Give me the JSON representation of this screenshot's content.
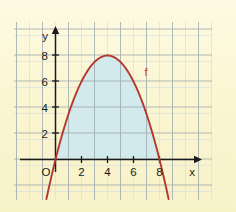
{
  "figure": {
    "background_color": "#fbf6d2",
    "grid_color": "#9aa8b0",
    "grid_minor_color": "#c9d2d4",
    "axis_color": "#1a1a1a",
    "curve_color": "#b43830",
    "fill_color": "#cfe8ef",
    "curve_label": "f",
    "origin_label": "O",
    "x_axis_label": "x",
    "y_axis_label": "y"
  },
  "chart_data": {
    "type": "line",
    "title": "",
    "xlabel": "x",
    "ylabel": "y",
    "grid": true,
    "legend": "none",
    "xlim": [
      -1.2,
      11.5
    ],
    "ylim": [
      -1.6,
      9.6
    ],
    "xticks": [
      2,
      4,
      6,
      8
    ],
    "yticks": [
      2,
      4,
      6,
      8
    ],
    "xtick_labels": [
      "2",
      "4",
      "6",
      "8"
    ],
    "ytick_labels": [
      "2",
      "4",
      "6",
      "8"
    ],
    "series": [
      {
        "name": "f",
        "label": "f",
        "color": "#b43830",
        "equation": "f(x) = 8 - 0.5*(x-4)^2",
        "vertex": [
          4,
          8
        ],
        "roots": [
          0.0,
          8.0
        ],
        "x": [
          -0.5,
          0.0,
          0.5,
          1.0,
          1.5,
          2.0,
          2.5,
          3.0,
          3.5,
          4.0,
          4.5,
          5.0,
          5.5,
          6.0,
          6.5,
          7.0,
          7.5,
          8.0,
          8.5
        ],
        "y": [
          -2.13,
          0.0,
          1.88,
          3.5,
          4.88,
          6.0,
          6.88,
          7.5,
          7.88,
          8.0,
          7.88,
          7.5,
          6.88,
          6.0,
          4.88,
          3.5,
          1.88,
          0.0,
          -2.13
        ]
      }
    ],
    "shaded_region": {
      "fill": "#cfe8ef",
      "x_from": 0.0,
      "x_to": 8.0,
      "description": "area under f between the roots"
    },
    "annotations": [
      {
        "text": "f",
        "x": 7.0,
        "y": 6.6,
        "color": "#b43830"
      },
      {
        "text": "O",
        "x": -0.45,
        "y": -0.75,
        "color": "#1a1a1a"
      }
    ]
  }
}
